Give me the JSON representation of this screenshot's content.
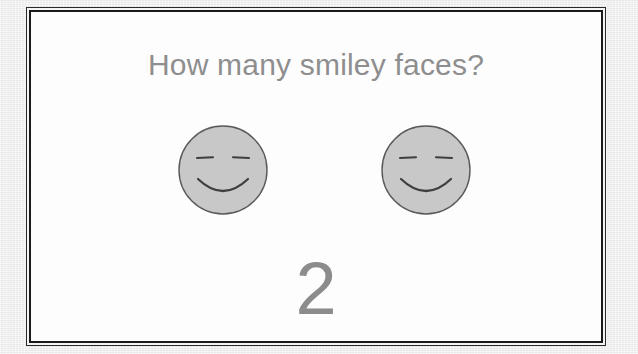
{
  "slide": {
    "title": "How many smiley faces?",
    "count_label": "2",
    "background_color": "#fdfdfd",
    "page_margin_color": "#ececec",
    "frame_border_color": "#1a1a1a",
    "text_color": "#8e8e8e",
    "count_color": "#8c8c8c"
  },
  "faces": {
    "item_count": 2,
    "fill_color": "#c8c8c8",
    "stroke_color": "#4a4a4a",
    "items": [
      {
        "name": "smiley-face-1",
        "expression": "smiling",
        "eyes": "two-horizontal-dashes",
        "mouth": "upward-curve"
      },
      {
        "name": "smiley-face-2",
        "expression": "smiling",
        "eyes": "two-horizontal-dashes",
        "mouth": "upward-curve"
      }
    ]
  }
}
